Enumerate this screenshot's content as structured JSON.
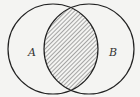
{
  "diagram": {
    "type": "venn",
    "sets": [
      {
        "label": "A",
        "cx": 53,
        "cy": 49,
        "r": 45,
        "label_x": 28,
        "label_y": 56
      },
      {
        "label": "B",
        "cx": 89,
        "cy": 49,
        "r": 45,
        "label_x": 109,
        "label_y": 56
      }
    ],
    "shaded_region": "A ∩ B",
    "hatch_color": "#555555",
    "stroke_color": "#222222",
    "background": "#f4f4f2"
  }
}
